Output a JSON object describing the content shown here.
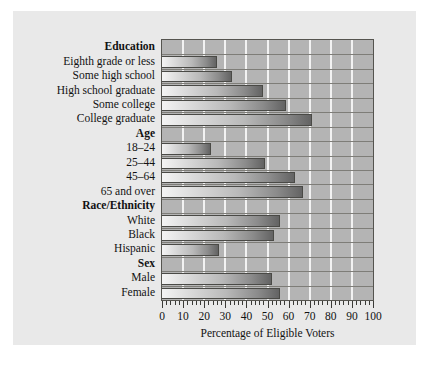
{
  "chart_data": {
    "type": "bar",
    "orientation": "horizontal",
    "title": "",
    "xlabel": "Percentage of Eligible Voters",
    "ylabel": "",
    "xlim": [
      0,
      100
    ],
    "xticks": [
      0,
      10,
      20,
      30,
      40,
      50,
      60,
      70,
      80,
      90,
      100
    ],
    "xtick_labels": [
      "0",
      "10",
      "20",
      "30",
      "40",
      "50",
      "60",
      "70",
      "80",
      "90",
      "100"
    ],
    "minor_tick_step": 2,
    "grid": true,
    "grid_axis": "x",
    "legend": null,
    "plot_background": "#b4b4b4",
    "gridline_color": "#f2f2f2",
    "bar_fill_light": "#f4f4f4",
    "bar_fill_dark": "#636363",
    "bar_edge_color": "#4a4a46",
    "groups": [
      {
        "name": "Education",
        "categories": [
          "Eighth grade or less",
          "Some high school",
          "High school graduate",
          "Some college",
          "College graduate"
        ],
        "values": [
          26,
          33,
          48,
          59,
          71
        ]
      },
      {
        "name": "Age",
        "categories": [
          "18–24",
          "25–44",
          "45–64",
          "65 and over"
        ],
        "values": [
          23,
          49,
          63,
          67
        ]
      },
      {
        "name": "Race/Ethnicity",
        "categories": [
          "White",
          "Black",
          "Hispanic"
        ],
        "values": [
          56,
          53,
          27
        ]
      },
      {
        "name": "Sex",
        "categories": [
          "Male",
          "Female"
        ],
        "values": [
          52,
          56
        ]
      }
    ]
  }
}
